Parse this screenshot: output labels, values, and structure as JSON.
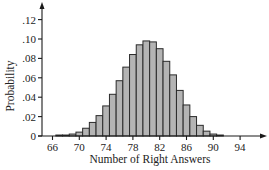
{
  "chart_data": {
    "type": "bar",
    "title": "",
    "xlabel": "Number of Right Answers",
    "ylabel": "Probability",
    "x": [
      67,
      68,
      69,
      70,
      71,
      72,
      73,
      74,
      75,
      76,
      77,
      78,
      79,
      80,
      81,
      82,
      83,
      84,
      85,
      86,
      87,
      88,
      89,
      90,
      91
    ],
    "values": [
      0.001,
      0.001,
      0.002,
      0.004,
      0.008,
      0.014,
      0.021,
      0.031,
      0.043,
      0.057,
      0.071,
      0.084,
      0.094,
      0.098,
      0.097,
      0.09,
      0.077,
      0.063,
      0.047,
      0.032,
      0.02,
      0.011,
      0.005,
      0.002,
      0.001
    ],
    "xticks": [
      66,
      70,
      74,
      78,
      82,
      86,
      90,
      94
    ],
    "xtick_labels": [
      "66",
      "70",
      "74",
      "78",
      "82",
      "86",
      "90",
      "94"
    ],
    "yticks": [
      0,
      0.02,
      0.04,
      0.06,
      0.08,
      0.1,
      0.12
    ],
    "ytick_labels": [
      "0",
      ".02",
      ".04",
      ".06",
      ".08",
      ".10",
      ".12"
    ],
    "xlim": [
      64.5,
      97
    ],
    "ylim": [
      0,
      0.137
    ],
    "grid": false,
    "legend": null,
    "bar_color": "#b4b4b4",
    "edge_color": "#2a2a2a"
  }
}
